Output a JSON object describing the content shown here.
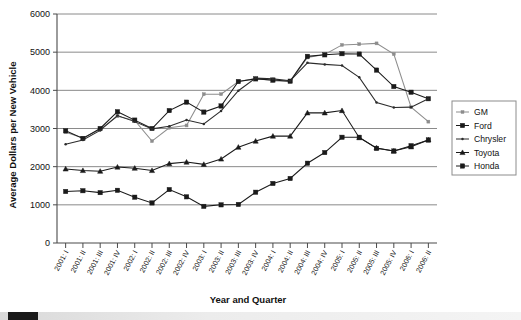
{
  "chart_data": {
    "type": "line",
    "title": "",
    "xlabel": "Year and Quarter",
    "ylabel": "Average Dollars per New Vehicle",
    "ylim": [
      0,
      6000
    ],
    "yticks": [
      0,
      1000,
      2000,
      3000,
      4000,
      5000,
      6000
    ],
    "grid": "horizontal",
    "legend_position": "right",
    "categories": [
      "2001: I",
      "2001: II",
      "2001: III",
      "2001: IV",
      "2002: I",
      "2002: II",
      "2002: III",
      "2002: IV",
      "2003: I",
      "2003: II",
      "2003: III",
      "2003: IV",
      "2004: I",
      "2004: II",
      "2004: III",
      "2004: IV",
      "2005: I",
      "2005: II",
      "2005: III",
      "2005: IV",
      "2006: I",
      "2006: II"
    ],
    "series": [
      {
        "name": "GM",
        "marker": "small-square",
        "color": "#8d8d8d",
        "values": [
          2900,
          2750,
          2980,
          3320,
          3210,
          2670,
          3020,
          3080,
          3900,
          3900,
          4230,
          4310,
          4250,
          4230,
          4860,
          4940,
          5190,
          5210,
          5230,
          4950,
          3560,
          3180
        ]
      },
      {
        "name": "Ford",
        "marker": "filled-square",
        "color": "#1a1a1a",
        "values": [
          2940,
          2740,
          3000,
          3440,
          3220,
          3000,
          3470,
          3690,
          3430,
          3590,
          4230,
          4300,
          4270,
          4240,
          4890,
          4930,
          4960,
          4950,
          4530,
          4100,
          3950,
          3780
        ]
      },
      {
        "name": "Chrysler",
        "marker": "small-dot",
        "color": "#2b2b2b",
        "values": [
          2590,
          2700,
          2950,
          3340,
          3180,
          2990,
          3060,
          3220,
          3120,
          3460,
          3990,
          4320,
          4300,
          4250,
          4720,
          4680,
          4650,
          4340,
          3680,
          3550,
          3560,
          3780
        ]
      },
      {
        "name": "Toyota",
        "marker": "triangle",
        "color": "#1a1a1a",
        "values": [
          1940,
          1900,
          1880,
          1990,
          1960,
          1900,
          2080,
          2120,
          2060,
          2200,
          2510,
          2670,
          2800,
          2800,
          3410,
          3410,
          3470,
          2760,
          2490,
          2410,
          2520,
          2700
        ]
      },
      {
        "name": "Honda",
        "marker": "filled-square",
        "color": "#1a1a1a",
        "values": [
          1350,
          1370,
          1320,
          1380,
          1200,
          1050,
          1400,
          1210,
          960,
          1000,
          1010,
          1330,
          1560,
          1690,
          2090,
          2370,
          2770,
          2770,
          2480,
          2410,
          2550,
          2700
        ]
      }
    ]
  },
  "legend": {
    "items": [
      {
        "label": "GM"
      },
      {
        "label": "Ford"
      },
      {
        "label": "Chrysler"
      },
      {
        "label": "Toyota"
      },
      {
        "label": "Honda"
      }
    ]
  },
  "axes": {
    "y_title": "Average Dollars per New Vehicle",
    "x_title": "Year and Quarter"
  }
}
